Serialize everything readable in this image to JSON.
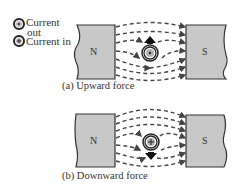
{
  "legend": {
    "current_out": {
      "label_line1": "Current",
      "label_line2": "out",
      "symbol": "dot-in-circle"
    },
    "current_in": {
      "label": "Current in",
      "symbol": "cross-in-circle"
    }
  },
  "panels": [
    {
      "id": "a",
      "caption": "(a) Upward force",
      "north_label": "N",
      "south_label": "S",
      "conductor": "current-out",
      "force_direction": "up"
    },
    {
      "id": "b",
      "caption": "(b) Downward force",
      "north_label": "N",
      "south_label": "S",
      "conductor": "current-in",
      "force_direction": "down"
    }
  ],
  "colors": {
    "magnet_fill": "#c8c8c8",
    "magnet_stroke": "#333333",
    "arrow": "#444444",
    "conductor_core": "#b0b0b0"
  }
}
